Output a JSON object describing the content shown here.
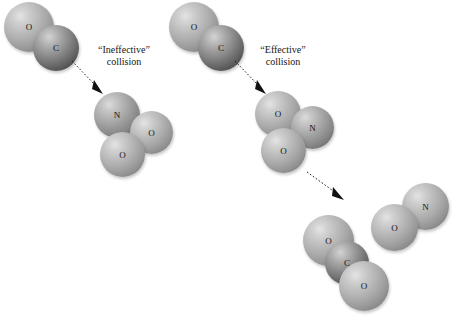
{
  "figure": {
    "background_color": "#ffffff",
    "atom_colors": {
      "oxygen": "#a9a9a9",
      "nitrogen": "#a9a9a9",
      "carbon": "#737373",
      "outline": "#676767",
      "text": "#141414"
    }
  },
  "labels": {
    "ineffective": {
      "line1": "“Ineffective”",
      "line2": "collision"
    },
    "effective": {
      "line1": "“Effective”",
      "line2": "collision"
    }
  },
  "atom_symbols": {
    "oxygen": "O",
    "carbon": "C",
    "nitrogen": "N"
  },
  "molecules": [
    {
      "id": "co-reactant-left",
      "formula": "CO",
      "name": "carbon monoxide",
      "atoms": [
        {
          "element": "O",
          "symbol": "O"
        },
        {
          "element": "C",
          "symbol": "C"
        }
      ]
    },
    {
      "id": "no2-target-left",
      "formula": "NO2",
      "name": "nitrogen dioxide",
      "atoms": [
        {
          "element": "N",
          "symbol": "N"
        },
        {
          "element": "O",
          "symbol": "O"
        },
        {
          "element": "O",
          "symbol": "O"
        }
      ]
    },
    {
      "id": "co-reactant-right",
      "formula": "CO",
      "name": "carbon monoxide",
      "atoms": [
        {
          "element": "O",
          "symbol": "O"
        },
        {
          "element": "C",
          "symbol": "C"
        }
      ]
    },
    {
      "id": "no2-target-right",
      "formula": "NO2",
      "name": "nitrogen dioxide",
      "atoms": [
        {
          "element": "O",
          "symbol": "O"
        },
        {
          "element": "N",
          "symbol": "N"
        },
        {
          "element": "O",
          "symbol": "O"
        }
      ]
    },
    {
      "id": "co2-product",
      "formula": "CO2",
      "name": "carbon dioxide",
      "atoms": [
        {
          "element": "O",
          "symbol": "O"
        },
        {
          "element": "C",
          "symbol": "C"
        },
        {
          "element": "O",
          "symbol": "O"
        }
      ]
    },
    {
      "id": "no-product",
      "formula": "NO",
      "name": "nitric oxide",
      "atoms": [
        {
          "element": "O",
          "symbol": "O"
        },
        {
          "element": "N",
          "symbol": "N"
        }
      ]
    }
  ],
  "arrows": [
    {
      "id": "arrow-ineffective",
      "style": "dotted",
      "direction": "down-right"
    },
    {
      "id": "arrow-effective",
      "style": "dotted",
      "direction": "down-right"
    },
    {
      "id": "arrow-products",
      "style": "dotted",
      "direction": "down-right"
    }
  ]
}
